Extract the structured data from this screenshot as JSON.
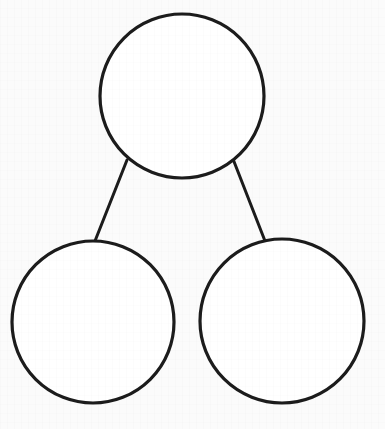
{
  "page": {
    "background_color": "#fbfbfb",
    "width": 385,
    "height": 429
  },
  "diagram": {
    "type": "number-bond",
    "stroke_color": "#1c1c1c",
    "fill_color": "#ffffff",
    "stroke_width": 3,
    "nodes": [
      {
        "id": "whole",
        "role": "whole",
        "label": "",
        "cx": 182,
        "cy": 96,
        "r": 82
      },
      {
        "id": "part-left",
        "role": "part",
        "label": "",
        "cx": 93,
        "cy": 322,
        "r": 81
      },
      {
        "id": "part-right",
        "role": "part",
        "label": "",
        "cx": 282,
        "cy": 321,
        "r": 82
      }
    ],
    "connectors": [
      {
        "id": "connector-left",
        "from": "whole",
        "to": "part-left",
        "x1": 127,
        "y1": 160,
        "x2": 95,
        "y2": 241
      },
      {
        "id": "connector-right",
        "from": "whole",
        "to": "part-right",
        "x1": 233,
        "y1": 159,
        "x2": 265,
        "y2": 241
      }
    ]
  }
}
